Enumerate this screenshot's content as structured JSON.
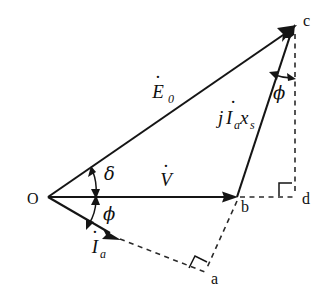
{
  "figure": {
    "background_color": "#ffffff",
    "line_color": "#151515",
    "width": 333,
    "height": 301
  },
  "points": {
    "origin": {
      "label": "O",
      "x": 48,
      "y": 197
    },
    "b": {
      "label": "b",
      "x": 237,
      "y": 197
    },
    "c": {
      "label": "c",
      "x": 296,
      "y": 26
    },
    "d": {
      "label": "d",
      "x": 295,
      "y": 197
    },
    "a": {
      "label": "a",
      "x": 205,
      "y": 272
    }
  },
  "phasors": [
    {
      "name": "terminal-voltage",
      "label": "V",
      "accent": "dot",
      "from": "O",
      "to": "b",
      "style": "solid"
    },
    {
      "name": "internal-emf",
      "label": "E",
      "accent": "dot",
      "subscript": "0",
      "from": "O",
      "to": "c",
      "style": "solid"
    },
    {
      "name": "armature-current",
      "label": "I",
      "accent": "dot",
      "subscript": "a",
      "from": "O",
      "to": "ia-tip",
      "style": "solid"
    },
    {
      "name": "reactance-drop",
      "label": "jI",
      "accent": "dot",
      "subscript": "a",
      "suffix": "x",
      "suffix_subscript": "s",
      "from": "b",
      "to": "c",
      "style": "solid"
    }
  ],
  "labels": {
    "voltage": {
      "base": "V",
      "sub": ""
    },
    "emf": {
      "base": "E",
      "sub": "0"
    },
    "current": {
      "base": "I",
      "sub": "a"
    },
    "reactance_drop": {
      "j": "j",
      "base": "I",
      "sub_a": "a",
      "x": "x",
      "sub_s": "s"
    },
    "delta": "δ",
    "phi_origin": "ϕ",
    "phi_top": "ϕ"
  },
  "angles": [
    {
      "name": "power-angle-delta",
      "symbol": "δ",
      "at": "O",
      "between": [
        "V",
        "E0"
      ],
      "label_x": 104,
      "label_y": 176
    },
    {
      "name": "power-factor-angle-phi-origin",
      "symbol": "ϕ",
      "at": "O",
      "between": [
        "Ia",
        "V"
      ],
      "label_x": 106,
      "label_y": 214
    },
    {
      "name": "power-factor-angle-phi-top",
      "symbol": "ϕ",
      "at": "c",
      "between": [
        "cb",
        "cd"
      ],
      "label_x": 276,
      "label_y": 95
    }
  ],
  "dashed_lines": [
    {
      "name": "b-to-d-horizontal",
      "from": "b",
      "to": "d"
    },
    {
      "name": "c-to-d-vertical",
      "from": "c",
      "to": "d"
    },
    {
      "name": "ia-extension-to-a",
      "from": "ia-tip",
      "to": "a"
    },
    {
      "name": "b-to-a",
      "from": "b",
      "to": "a"
    }
  ],
  "right_angles": [
    {
      "name": "right-angle-at-d",
      "at": "d"
    },
    {
      "name": "right-angle-at-a",
      "at": "a"
    }
  ]
}
